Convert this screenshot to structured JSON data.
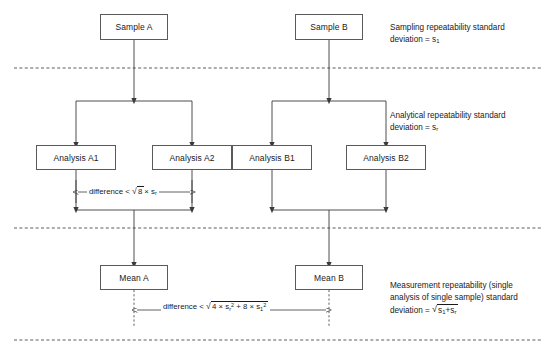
{
  "diagram": {
    "nodes": [
      {
        "id": "sample-a",
        "label": "Sample A"
      },
      {
        "id": "sample-b",
        "label": "Sample B"
      },
      {
        "id": "analysis-a1",
        "label": "Analysis A1"
      },
      {
        "id": "analysis-a2",
        "label": "Analysis A2"
      },
      {
        "id": "analysis-b1",
        "label": "Analysis B1"
      },
      {
        "id": "analysis-b2",
        "label": "Analysis B2"
      },
      {
        "id": "mean-a",
        "label": "Mean A"
      },
      {
        "id": "mean-b",
        "label": "Mean B"
      }
    ],
    "side_labels": [
      {
        "id": "sampling-repeatability",
        "line1": "Sampling repeatability standard",
        "line2_prefix": "deviation = s",
        "line2_sub": "1"
      },
      {
        "id": "analytical-repeatability",
        "line1": "Analytical repeatability standard",
        "line2_prefix": "deviation = s",
        "line2_sub": "r"
      },
      {
        "id": "measurement-repeatability",
        "line1": "Measurement repeatability (single",
        "line2": "analysis of single sample) standard",
        "line3_prefix": "deviation = ",
        "radical_symbol": "√",
        "radicand_a": "s",
        "radicand_a_sub": "1",
        "radicand_op": "+",
        "radicand_b": "s",
        "radicand_b_sub": "r"
      }
    ],
    "annotations": [
      {
        "id": "analysis-difference",
        "prefix": "difference < ",
        "radical_symbol": "√",
        "radicand": "8",
        "suffix_times": "× ",
        "suffix_var": "s",
        "suffix_sub": "r"
      },
      {
        "id": "mean-difference",
        "prefix": "difference < ",
        "radical_symbol": "√",
        "term1_coeff": "4 × ",
        "term1_var": "s",
        "term1_sub": "r",
        "term1_sup": "2",
        "term_op": " + ",
        "term2_coeff": "8 × ",
        "term2_var": "s",
        "term2_sub": "1",
        "term2_sup": "2"
      }
    ],
    "colors": {
      "box_border": "#5a5a5a",
      "connector": "#3a3a3a",
      "divider": "#4a4a4a",
      "text": "#1a1a1a",
      "background": "#ffffff"
    }
  }
}
